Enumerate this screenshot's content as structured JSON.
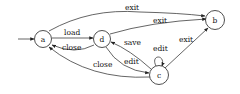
{
  "diagram": {
    "type": "state-machine",
    "colors": {
      "stroke": "#222222",
      "fill": "#ffffff",
      "text": "#111111"
    },
    "nodes": [
      {
        "id": "a",
        "label": "a",
        "initial": true
      },
      {
        "id": "d",
        "label": "d"
      },
      {
        "id": "c",
        "label": "c"
      },
      {
        "id": "b",
        "label": "b"
      }
    ],
    "edges": [
      {
        "from": "a",
        "to": "d",
        "label": "load"
      },
      {
        "from": "d",
        "to": "a",
        "label": "close"
      },
      {
        "from": "a",
        "to": "b",
        "label": "exit"
      },
      {
        "from": "d",
        "to": "b",
        "label": "exit"
      },
      {
        "from": "c",
        "to": "d",
        "label": "save"
      },
      {
        "from": "d",
        "to": "c",
        "label": "edit"
      },
      {
        "from": "c",
        "to": "c",
        "label": "edit"
      },
      {
        "from": "c",
        "to": "a",
        "label": "close"
      },
      {
        "from": "c",
        "to": "b",
        "label": "exit"
      }
    ]
  }
}
